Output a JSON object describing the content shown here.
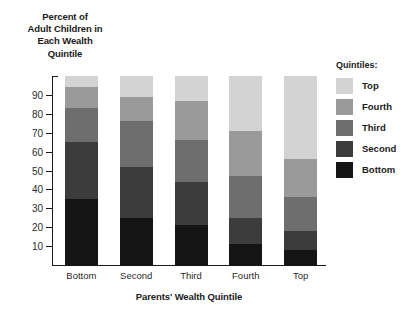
{
  "chart_data": {
    "type": "bar",
    "stacked": true,
    "stacked_100": true,
    "title": "",
    "ylabel": "Percent of Adult Children in Each Wealth Quintile",
    "ylabel_lines": [
      "Percent of",
      "Adult Children in",
      "Each Wealth",
      "Quintile"
    ],
    "xlabel": "Parents' Wealth Quintile",
    "categories": [
      "Bottom",
      "Second",
      "Third",
      "Fourth",
      "Top"
    ],
    "ylim": [
      0,
      100
    ],
    "yticks": [
      10,
      20,
      30,
      40,
      50,
      60,
      70,
      80,
      90
    ],
    "ytick_labels": [
      "10",
      "20",
      "30",
      "40",
      "50",
      "60",
      "70",
      "80",
      "90"
    ],
    "grid": false,
    "legend_position": "right",
    "legend_title": "Quintiles:",
    "series": [
      {
        "name": "Bottom",
        "color": "#141414",
        "values": [
          35,
          25,
          21,
          11,
          8
        ]
      },
      {
        "name": "Second",
        "color": "#3c3c3c",
        "values": [
          30,
          27,
          23,
          14,
          10
        ]
      },
      {
        "name": "Third",
        "color": "#6e6e6e",
        "values": [
          18,
          24,
          22,
          22,
          18
        ]
      },
      {
        "name": "Fourth",
        "color": "#9a9a9a",
        "values": [
          11,
          13,
          21,
          24,
          20
        ]
      },
      {
        "name": "Top",
        "color": "#d3d3d3",
        "values": [
          6,
          11,
          13,
          29,
          44
        ]
      }
    ],
    "stack_order_bottom_to_top": [
      "Bottom",
      "Second",
      "Third",
      "Fourth",
      "Top"
    ],
    "legend_entries_top_to_bottom": [
      {
        "label": "Top",
        "color": "#d3d3d3"
      },
      {
        "label": "Fourth",
        "color": "#9a9a9a"
      },
      {
        "label": "Third",
        "color": "#6e6e6e"
      },
      {
        "label": "Second",
        "color": "#3c3c3c"
      },
      {
        "label": "Bottom",
        "color": "#141414"
      }
    ],
    "cumulative_tops": {
      "Bottom": [
        35,
        65,
        83,
        94,
        100
      ],
      "Second": [
        25,
        52,
        76,
        89,
        100
      ],
      "Third": [
        21,
        44,
        66,
        87,
        100
      ],
      "Fourth": [
        11,
        25,
        47,
        71,
        100
      ],
      "Top": [
        8,
        18,
        36,
        56,
        100
      ]
    }
  }
}
